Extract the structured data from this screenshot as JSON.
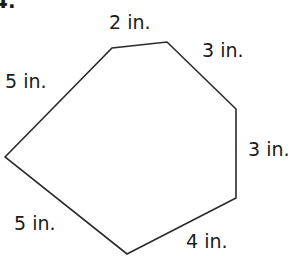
{
  "problem_number": "4.",
  "figure": {
    "shape": "hexagon",
    "stroke_color": "#2a2a2a",
    "sides": [
      {
        "label": "2 in."
      },
      {
        "label": "3 in."
      },
      {
        "label": "3 in."
      },
      {
        "label": "4 in."
      },
      {
        "label": "5 in."
      },
      {
        "label": "5 in."
      }
    ]
  }
}
